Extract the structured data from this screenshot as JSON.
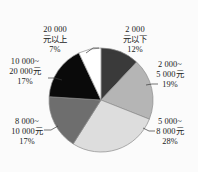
{
  "chart_data": {
    "type": "pie",
    "title": "",
    "subtitle": "",
    "xlabel": "",
    "ylabel": "",
    "legend_position": "none",
    "grid": false,
    "start_angle_deg": 0,
    "direction": "clockwise",
    "categories": [
      "2 000元以下",
      "2 000~5 000元",
      "5 000~8 000元",
      "8 000~10 000元",
      "10 000~20 000元",
      "20 000元以上"
    ],
    "values": [
      12,
      19,
      28,
      17,
      17,
      7
    ],
    "value_unit": "%",
    "colors": [
      "#3a3a3a",
      "#b5b5b5",
      "#dddddd",
      "#6e6e6e",
      "#0a0a0a",
      "#ffffff"
    ],
    "slices": [
      {
        "label_line1": "2 000",
        "label_line2": "元以下",
        "percent": "12%",
        "value": 12,
        "color": "#3a3a3a"
      },
      {
        "label_line1": "2 000~",
        "label_line2": "5 000元",
        "percent": "19%",
        "value": 19,
        "color": "#b5b5b5"
      },
      {
        "label_line1": "5 000~",
        "label_line2": "8 000元",
        "percent": "28%",
        "value": 28,
        "color": "#dddddd"
      },
      {
        "label_line1": "8 000~",
        "label_line2": "10 000元",
        "percent": "17%",
        "value": 17,
        "color": "#6e6e6e"
      },
      {
        "label_line1": "10 000~",
        "label_line2": "20 000元",
        "percent": "17%",
        "value": 17,
        "color": "#0a0a0a"
      },
      {
        "label_line1": "20 000",
        "label_line2": "元以上",
        "percent": "7%",
        "value": 7,
        "color": "#ffffff"
      }
    ]
  }
}
